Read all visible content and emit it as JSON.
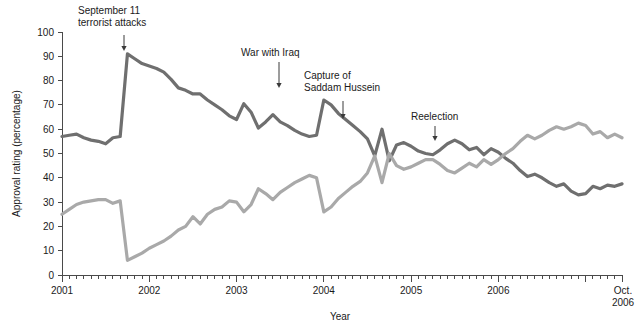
{
  "chart_data": {
    "type": "line",
    "title": "",
    "xlabel": "Year",
    "ylabel": "Approval rating (percentage)",
    "ylim": [
      0,
      100
    ],
    "ytick_step": 10,
    "yticks": [
      "0",
      "10",
      "20",
      "30",
      "40",
      "50",
      "60",
      "70",
      "80",
      "90",
      "100"
    ],
    "xlim": [
      "2001-01",
      "2006-10"
    ],
    "xticks": [
      "2001",
      "2002",
      "2003",
      "2004",
      "2005",
      "2006",
      "Oct. 2006"
    ],
    "xtick_labels": [
      "2001",
      "2002",
      "2003",
      "2004",
      "2005",
      "2006",
      "Oct."
    ],
    "xtick_label_secondline": [
      "",
      "",
      "",
      "",
      "",
      "",
      "2006"
    ],
    "minor_ticks": "monthly",
    "grid": false,
    "legend": "none",
    "colors": {
      "approve": "#6f6f6f",
      "disapprove": "#a9a9a9",
      "axis": "#4a4a4a",
      "text": "#1a1a1a",
      "background": "#ffffff"
    },
    "series": [
      {
        "name": "Approve",
        "color": "#6f6f6f",
        "values": [
          57,
          57.5,
          58,
          56.5,
          55.5,
          55,
          54,
          56.5,
          57,
          91,
          89,
          87,
          86,
          85,
          83.5,
          80.5,
          77,
          76,
          74.5,
          74.5,
          72,
          70,
          68,
          65.5,
          64,
          70.5,
          67,
          60.5,
          63,
          66,
          63,
          61.5,
          59.5,
          58,
          57,
          57.5,
          72,
          70,
          66.5,
          64,
          61.5,
          59,
          56,
          49,
          60,
          47,
          53.5,
          54.5,
          53,
          51,
          50,
          49.5,
          51.5,
          54,
          55.5,
          54,
          51.5,
          52.5,
          49.5,
          52,
          50.5,
          48,
          46,
          43,
          40.5,
          41.5,
          40,
          38,
          36.5,
          37.5,
          34.5,
          33,
          33.5,
          36.5,
          35.5,
          37,
          36.5,
          37.5
        ]
      },
      {
        "name": "Disapprove",
        "color": "#a9a9a9",
        "values": [
          25,
          27,
          29,
          30,
          30.5,
          31,
          31,
          29.5,
          30.5,
          6,
          7.5,
          9,
          11,
          12.5,
          14,
          16,
          18.5,
          20,
          24,
          21,
          25,
          27,
          28,
          30.5,
          30,
          26,
          29,
          35.5,
          33.5,
          31,
          34,
          36,
          38,
          39.5,
          41,
          40,
          26,
          28,
          31.5,
          34,
          36.5,
          38.5,
          42,
          49,
          38,
          50,
          45,
          43.5,
          44.5,
          46,
          47.5,
          47.5,
          45.5,
          43,
          42,
          44,
          46,
          44.5,
          47.5,
          45.5,
          47.5,
          50,
          52,
          55,
          57.5,
          56,
          57.5,
          59.5,
          61,
          60,
          61,
          62.5,
          61.5,
          58,
          59,
          56.5,
          58,
          56.5
        ]
      }
    ],
    "annotations": [
      {
        "label_lines": [
          "September 11",
          "terrorist attacks"
        ],
        "text_x": 78,
        "text_y": 14,
        "arrow_x": 124,
        "arrow_y_top": 35,
        "arrow_y_bottom": 51
      },
      {
        "label_lines": [
          "War with Iraq"
        ],
        "text_x": 241,
        "text_y": 56,
        "arrow_x": 279,
        "arrow_y_top": 62,
        "arrow_y_bottom": 88
      },
      {
        "label_lines": [
          "Capture of",
          "Saddam Hussein"
        ],
        "text_x": 304,
        "text_y": 79,
        "arrow_x": 343,
        "arrow_y_top": 101,
        "arrow_y_bottom": 119
      },
      {
        "label_lines": [
          "Reelection"
        ],
        "text_x": 411,
        "text_y": 120,
        "arrow_x": 435,
        "arrow_y_top": 126,
        "arrow_y_bottom": 141
      }
    ]
  }
}
